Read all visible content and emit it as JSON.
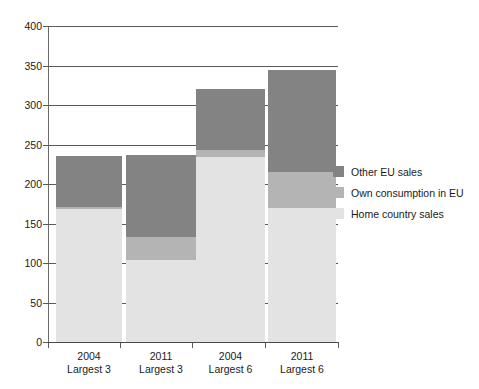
{
  "chart_data": {
    "type": "bar",
    "stacked": true,
    "title": "",
    "xlabel": "",
    "ylabel": "",
    "ylim": [
      0,
      400
    ],
    "ytick_step": 50,
    "yticks": [
      400,
      350,
      300,
      250,
      200,
      150,
      100,
      50,
      0
    ],
    "grid": true,
    "legend_position": "right",
    "categories": [
      "2004 Largest 3",
      "2011 Largest 3",
      "2004 Largest 6",
      "2011 Largest 6"
    ],
    "category_lines": [
      {
        "year": "2004",
        "group": "Largest 3"
      },
      {
        "year": "2011",
        "group": "Largest 3"
      },
      {
        "year": "2004",
        "group": "Largest 6"
      },
      {
        "year": "2011",
        "group": "Largest 6"
      }
    ],
    "series": [
      {
        "name": "Home country sales",
        "color": "#e3e3e3",
        "values": [
          168,
          104,
          234,
          170
        ]
      },
      {
        "name": "Own consumption in EU",
        "color": "#b4b4b4",
        "values": [
          3,
          29,
          9,
          45
        ]
      },
      {
        "name": "Other EU sales",
        "color": "#838383",
        "values": [
          64,
          104,
          77,
          129
        ]
      }
    ],
    "totals": [
      235,
      237,
      320,
      344
    ]
  },
  "legend": {
    "items": [
      {
        "label": "Other EU sales",
        "color": "#838383"
      },
      {
        "label": "Own consumption in EU",
        "color": "#b4b4b4"
      },
      {
        "label": "Home country sales",
        "color": "#e3e3e3"
      }
    ]
  },
  "axis": {
    "y_tick_labels": [
      "400",
      "350",
      "300",
      "250",
      "200",
      "150",
      "100",
      "50",
      "0"
    ]
  }
}
